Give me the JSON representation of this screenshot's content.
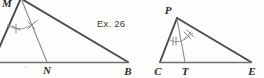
{
  "figure": {
    "caption_ref": "Ex. 26",
    "background_color": "#fdfdfb",
    "ink_color": "#4a4a4a",
    "width": 264,
    "height": 78
  },
  "left_figure": {
    "name": "triangle-with-angle-bisector-left",
    "cropped": true,
    "apex_label": "M",
    "foot_label": "N",
    "right_vertex_label": "B",
    "angle_mark_left": "single-tick",
    "angle_mark_right": "cross-tick",
    "vertices": {
      "apex": [
        22,
        0
      ],
      "left": [
        -6,
        62
      ],
      "right": [
        128,
        62
      ],
      "foot": [
        47,
        62
      ]
    }
  },
  "right_figure": {
    "name": "triangle-pce-with-cevian",
    "apex_label": "P",
    "left_vertex_label": "C",
    "foot_label": "T",
    "right_vertex_label": "E",
    "angle_mark_left": "double-tick",
    "angle_mark_right": "cross-tick",
    "vertices": {
      "apex": [
        177,
        18
      ],
      "left": [
        160,
        62
      ],
      "right": [
        251,
        62
      ],
      "foot": [
        185,
        62
      ]
    }
  }
}
